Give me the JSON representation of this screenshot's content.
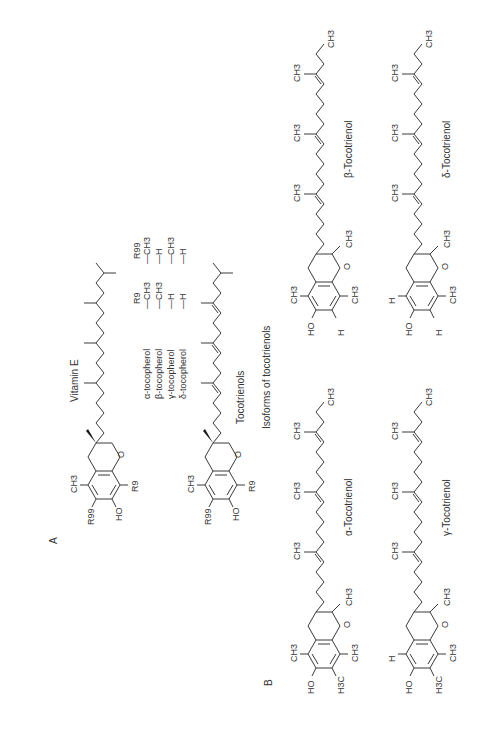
{
  "panels": {
    "a": {
      "label": "A",
      "title": "Vitamin E",
      "tocopherol_table": {
        "headers": [
          "R9",
          "R99"
        ],
        "rows": [
          {
            "name": "α-tocopherol",
            "r9": "—CH3",
            "r99": "—CH3"
          },
          {
            "name": "β-tocopherol",
            "r9": "—CH3",
            "r99": "—H"
          },
          {
            "name": "γ-tocopherol",
            "r9": "—H",
            "r99": "—CH3"
          },
          {
            "name": "δ-tocopherol",
            "r9": "—H",
            "r99": "—H"
          }
        ]
      },
      "tocopherol_labels": {
        "ch3": "CH3",
        "r9": "R9",
        "r99": "R99",
        "ho": "HO",
        "o": "O"
      },
      "tocotrienol_title": "Tocotrienols"
    },
    "b": {
      "label": "B",
      "title": "Isoforms of tocotrienols",
      "isoforms": [
        {
          "name": "α-Tocotrienol",
          "r5": "CH3",
          "r7": "H3C",
          "r8": "CH3"
        },
        {
          "name": "β-Tocotrienol",
          "r5": "CH3",
          "r7": "H",
          "r8": "CH3"
        },
        {
          "name": "γ-Tocotrienol",
          "r5": "H",
          "r7": "H3C",
          "r8": "CH3"
        },
        {
          "name": "δ-Tocotrienol",
          "r5": "H",
          "r7": "H",
          "r8": "CH3"
        }
      ],
      "common_labels": {
        "ho": "HO",
        "o": "O",
        "ch3": "CH3"
      }
    }
  }
}
